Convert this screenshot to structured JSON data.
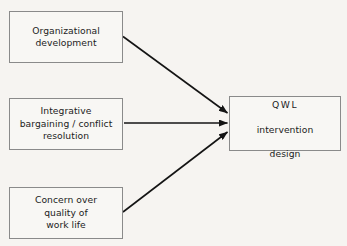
{
  "diagram": {
    "type": "flow-diagram",
    "background_color": "#f6f4f1",
    "line_color": "#141414",
    "box_border_color": "#8a8a8a",
    "text_color": "#1c1c1c",
    "nodes": [
      {
        "id": "organizational-development",
        "label": "Organizational\ndevelopment",
        "line1": "Organizational",
        "line2": "development",
        "role": "source",
        "position": "top-left"
      },
      {
        "id": "integrative-bargaining",
        "label": "Integrative\nbargaining / conflict\nresolution",
        "line1": "Integrative",
        "line2": "bargaining / conflict",
        "line3": "resolution",
        "role": "source",
        "position": "middle-left"
      },
      {
        "id": "concern-quality-work-life",
        "label": "Concern over\nquality of\nwork life",
        "line1": "Concern over",
        "line2": "quality of",
        "line3": "work life",
        "role": "source",
        "position": "bottom-left"
      },
      {
        "id": "qwl-intervention-design",
        "label": "QWL\nintervention\ndesign",
        "line1": "QWL",
        "line2": "intervention",
        "line3": "design",
        "role": "target",
        "position": "middle-right"
      }
    ],
    "edges": [
      {
        "id": "edge-od-to-qwl",
        "from": "organizational-development",
        "to": "qwl-intervention-design",
        "style": "solid-arrow",
        "direction": "down-right"
      },
      {
        "id": "edge-bargaining-to-qwl",
        "from": "integrative-bargaining",
        "to": "qwl-intervention-design",
        "style": "solid-arrow",
        "direction": "horizontal"
      },
      {
        "id": "edge-concern-to-qwl",
        "from": "concern-quality-work-life",
        "to": "qwl-intervention-design",
        "style": "solid-arrow",
        "direction": "up-right"
      }
    ]
  }
}
